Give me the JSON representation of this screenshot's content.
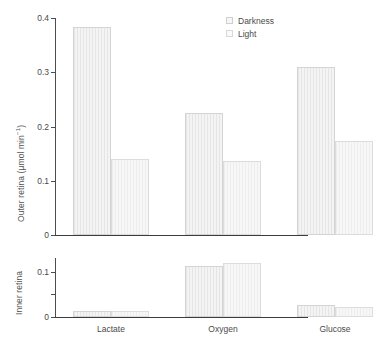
{
  "chart_data": {
    "type": "bar",
    "title": "",
    "categories": [
      "Lactate",
      "Oxygen",
      "Glucose"
    ],
    "legend_position": "top-right",
    "grid": false,
    "panels": [
      {
        "name": "outer-retina",
        "ylabel": "Outer retina (µmol min",
        "ylabel_sup": "−1",
        "ylabel_tail": ")",
        "ylim": [
          0,
          0.4
        ],
        "yticks": [
          0,
          0.1,
          0.2,
          0.3,
          0.4
        ],
        "yticklabels": [
          "0",
          "0.1",
          "0.2",
          "0.3",
          "0.4"
        ],
        "series": [
          {
            "name": "Darkness",
            "values": [
              0.383,
              0.225,
              0.31
            ]
          },
          {
            "name": "Light",
            "values": [
              0.141,
              0.136,
              0.173
            ]
          }
        ]
      },
      {
        "name": "inner-retina",
        "ylabel": "Inner retina",
        "ylim": [
          0,
          0.13
        ],
        "yticks": [
          0,
          0.05,
          0.1
        ],
        "yticklabels": [
          "0",
          "",
          "0.1"
        ],
        "series": [
          {
            "name": "Darkness",
            "values": [
              0.013,
              0.113,
              0.027
            ]
          },
          {
            "name": "Light",
            "values": [
              0.013,
              0.12,
              0.022
            ]
          }
        ]
      }
    ],
    "legend": [
      {
        "label": "Darkness",
        "swatch": "darkness-swatch"
      },
      {
        "label": "Light",
        "swatch": "light-swatch"
      }
    ],
    "xlabel": "",
    "colors": {
      "bar_fill": "#f4f4f4",
      "bar_border": "#d4d4d4",
      "axis": "#4d4d4d",
      "text": "#4a4a4a",
      "background": "#ffffff"
    }
  }
}
